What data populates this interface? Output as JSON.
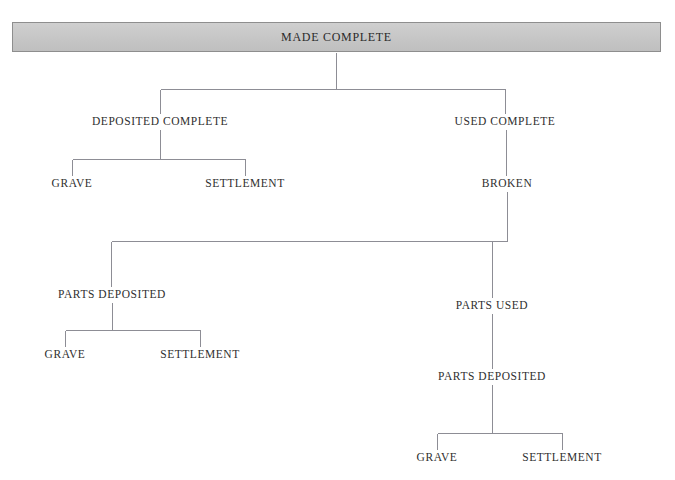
{
  "diagram": {
    "title": "MADE COMPLETE",
    "type": "hierarchical-flow-chart",
    "line_color": "#8d8d95",
    "root_fill_color": "#c6c6c6",
    "root_border_color": "#8e8e8e",
    "text_color": "#2f2f2f",
    "root": {
      "id": "made-complete",
      "label": "MADE COMPLETE",
      "level": 0
    },
    "nodes": [
      {
        "id": "deposited-complete",
        "label": "DEPOSITED COMPLETE",
        "level": 1,
        "x": 160,
        "y": 121
      },
      {
        "id": "used-complete",
        "label": "USED COMPLETE",
        "level": 1,
        "x": 505,
        "y": 121
      },
      {
        "id": "grave-1",
        "label": "GRAVE",
        "level": 2,
        "x": 72,
        "y": 183
      },
      {
        "id": "settlement-1",
        "label": "SETTLEMENT",
        "level": 2,
        "x": 245,
        "y": 183
      },
      {
        "id": "broken",
        "label": "BROKEN",
        "level": 2,
        "x": 507,
        "y": 183
      },
      {
        "id": "parts-deposited-1",
        "label": "PARTS DEPOSITED",
        "level": 3,
        "x": 112,
        "y": 294
      },
      {
        "id": "parts-used",
        "label": "PARTS USED",
        "level": 3,
        "x": 492,
        "y": 305
      },
      {
        "id": "grave-2",
        "label": "GRAVE",
        "level": 4,
        "x": 65,
        "y": 354
      },
      {
        "id": "settlement-2",
        "label": "SETTLEMENT",
        "level": 4,
        "x": 200,
        "y": 354
      },
      {
        "id": "parts-deposited-2",
        "label": "PARTS DEPOSITED",
        "level": 4,
        "x": 492,
        "y": 376
      },
      {
        "id": "grave-3",
        "label": "GRAVE",
        "level": 5,
        "x": 437,
        "y": 457
      },
      {
        "id": "settlement-3",
        "label": "SETTLEMENT",
        "level": 5,
        "x": 562,
        "y": 457
      }
    ],
    "edges": [
      {
        "from": "made-complete",
        "to": "deposited-complete"
      },
      {
        "from": "made-complete",
        "to": "used-complete"
      },
      {
        "from": "deposited-complete",
        "to": "grave-1"
      },
      {
        "from": "deposited-complete",
        "to": "settlement-1"
      },
      {
        "from": "used-complete",
        "to": "broken"
      },
      {
        "from": "broken",
        "to": "parts-deposited-1"
      },
      {
        "from": "broken",
        "to": "parts-used"
      },
      {
        "from": "parts-deposited-1",
        "to": "grave-2"
      },
      {
        "from": "parts-deposited-1",
        "to": "settlement-2"
      },
      {
        "from": "parts-used",
        "to": "parts-deposited-2"
      },
      {
        "from": "parts-deposited-2",
        "to": "grave-3"
      },
      {
        "from": "parts-deposited-2",
        "to": "settlement-3"
      }
    ]
  }
}
